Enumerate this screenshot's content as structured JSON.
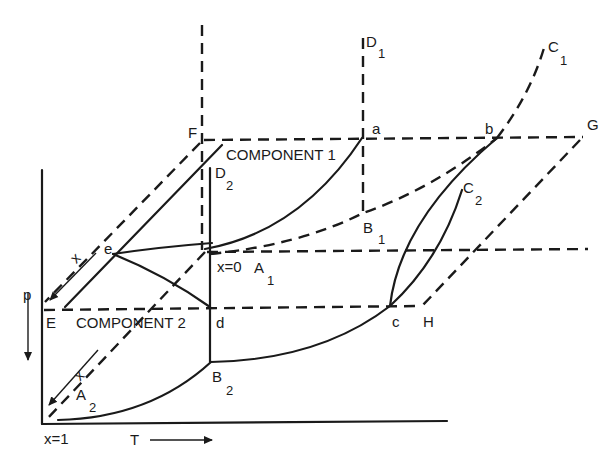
{
  "figure": {
    "planes": {
      "component1": "COMPONENT 1",
      "component2": "COMPONENT 2"
    },
    "axes": {
      "pressure": "p",
      "temperature": "T",
      "composition_top": "x",
      "composition_bottom": "x",
      "x_zero": "x=0",
      "x_one": "x=1"
    },
    "points": {
      "F": "F",
      "E": "E",
      "G": "G",
      "H": "H",
      "a": "a",
      "b": "b",
      "c": "c",
      "d": "d",
      "e": "e",
      "D1": {
        "main": "D",
        "sub": "1"
      },
      "D2": {
        "main": "D",
        "sub": "2"
      },
      "C1": {
        "main": "C",
        "sub": "1"
      },
      "C2": {
        "main": "C",
        "sub": "2"
      },
      "B1": {
        "main": "B",
        "sub": "1"
      },
      "B2": {
        "main": "B",
        "sub": "2"
      },
      "A1": {
        "main": "A",
        "sub": "1"
      },
      "A2": {
        "main": "A",
        "sub": "2"
      }
    }
  }
}
